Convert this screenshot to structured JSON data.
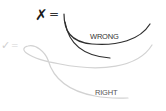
{
  "diagram": {
    "wrong": {
      "symbol": "✗",
      "equals": "=",
      "label": "WRONG",
      "stroke_color": "#2b2b2b"
    },
    "right": {
      "symbol": "✓",
      "equals": "=",
      "label": "RIGHT",
      "stroke_color": "#d0d0d0"
    }
  }
}
